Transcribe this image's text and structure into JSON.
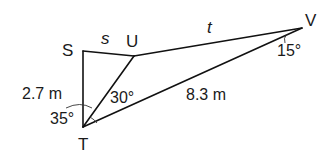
{
  "diagram": {
    "type": "geometry-triangles",
    "vertices": {
      "S": {
        "label": "S",
        "x": 83,
        "y": 51
      },
      "U": {
        "label": "U",
        "x": 134,
        "y": 56
      },
      "V": {
        "label": "V",
        "x": 302,
        "y": 28
      },
      "T": {
        "label": "T",
        "x": 83,
        "y": 127
      }
    },
    "segments": [
      {
        "from": "S",
        "to": "U",
        "label": "s"
      },
      {
        "from": "U",
        "to": "V",
        "label": "t"
      },
      {
        "from": "S",
        "to": "T",
        "label": "2.7 m"
      },
      {
        "from": "T",
        "to": "U",
        "label": ""
      },
      {
        "from": "T",
        "to": "V",
        "label": "8.3 m"
      }
    ],
    "angles": [
      {
        "at": "T",
        "between": [
          "S",
          "U"
        ],
        "label": "35°"
      },
      {
        "at": "T",
        "between": [
          "U",
          "V"
        ],
        "label": "30°"
      },
      {
        "at": "V",
        "between": [
          "U",
          "T"
        ],
        "label": "15°"
      }
    ],
    "labels": {
      "S": "S",
      "U": "U",
      "V": "V",
      "T": "T",
      "s": "s",
      "t": "t",
      "ST": "2.7 m",
      "TV": "8.3 m",
      "angle_T_lower": "35°",
      "angle_T_upper": "30°",
      "angle_V": "15°"
    }
  }
}
